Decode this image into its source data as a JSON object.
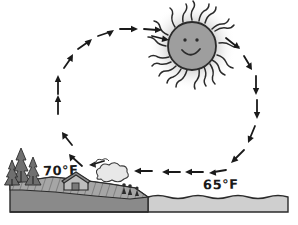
{
  "diagram": {
    "background_color": "#ffffff",
    "ink_color": "#1a1a1a"
  },
  "labels": {
    "land_temperature": "70°F",
    "water_temperature": "65°F"
  },
  "sun": {
    "name": "smiling-sun",
    "face_fill": "#9e9e9e",
    "outline_color": "#2b2b2b",
    "glow_color": "#d8d8d8",
    "ray_count": 20,
    "expression": "smiling",
    "center_x": 192,
    "center_y": 46,
    "radius": 24
  },
  "terrain": {
    "land": {
      "name": "land-mass",
      "fill": "#8a8a8a",
      "surface_fill": "#a6a6a6",
      "outline_color": "#2b2b2b"
    },
    "water": {
      "name": "water-body",
      "fill": "#cfcfcf",
      "outline_color": "#2b2b2b"
    },
    "trees": {
      "name": "pine-trees",
      "count": 3,
      "fill": "#6f6f6f"
    },
    "barn": {
      "name": "barn-building",
      "roof_fill": "#8c8c8c",
      "wall_fill": "#bdbdbd"
    },
    "smoke": {
      "name": "smoke-cloud",
      "fill": "#e8e8e8"
    },
    "figures": {
      "name": "people-figures",
      "count": 3,
      "fill": "#2b2b2b"
    }
  },
  "airflow": {
    "name": "convection-loop",
    "direction": "clockwise",
    "style": "dashed-arrows",
    "segments": [
      {
        "name": "rising-air-over-land",
        "arrow_count": 2,
        "direction": "up"
      },
      {
        "name": "upper-left-curve",
        "arrow_count": 4,
        "direction": "up-right"
      },
      {
        "name": "upper-flow-toward-sun",
        "arrow_count": 3,
        "direction": "right"
      },
      {
        "name": "sinking-air-over-water",
        "arrow_count": 5,
        "direction": "down"
      },
      {
        "name": "surface-breeze-toward-land",
        "arrow_count": 5,
        "direction": "left"
      }
    ]
  }
}
